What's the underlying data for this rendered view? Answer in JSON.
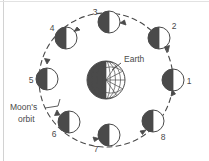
{
  "figure": {
    "title_text": "Moon phases diagram",
    "background_color": "#ffffff",
    "ink_color": "#3f3f3f",
    "dark_fill": "#4a4a4a",
    "light_fill": "#ffffff",
    "border": {
      "left_edge_color": "#cfcfcf",
      "top_edge_color": "#cfcfcf"
    }
  },
  "earth": {
    "label": "Earth",
    "center": {
      "x": 106,
      "y": 80
    },
    "radius": 19,
    "dark_half": "left",
    "grid_half": "right",
    "meridian_count": 5,
    "parallel_count": 3
  },
  "orbit": {
    "label_line1": "Moon's",
    "label_line2": "orbit",
    "center": {
      "x": 106,
      "y": 80
    },
    "radius": 67,
    "style": "dashed",
    "direction": "counterclockwise"
  },
  "moons": [
    {
      "id": "1",
      "label": "1",
      "angle_deg": 0,
      "cx": 173,
      "cy": 80,
      "r": 11,
      "dark_side": "left",
      "label_x": 189,
      "label_y": 84
    },
    {
      "id": "2",
      "label": "2",
      "angle_deg": 45,
      "cx": 159,
      "cy": 38,
      "r": 11,
      "dark_side": "left",
      "label_x": 174,
      "label_y": 29
    },
    {
      "id": "3",
      "label": "3",
      "angle_deg": 90,
      "cx": 109,
      "cy": 22,
      "r": 11,
      "dark_side": "left",
      "label_x": 95,
      "label_y": 15
    },
    {
      "id": "4",
      "label": "4",
      "angle_deg": 135,
      "cx": 66,
      "cy": 38,
      "r": 11,
      "dark_side": "left",
      "label_x": 52,
      "label_y": 31
    },
    {
      "id": "5",
      "label": "5",
      "angle_deg": 180,
      "cx": 47,
      "cy": 79,
      "r": 11,
      "dark_side": "left",
      "label_x": 31,
      "label_y": 83
    },
    {
      "id": "6",
      "label": "6",
      "angle_deg": 225,
      "cx": 69,
      "cy": 122,
      "r": 11,
      "dark_side": "left",
      "label_x": 54,
      "label_y": 137
    },
    {
      "id": "7",
      "label": "7",
      "angle_deg": 270,
      "cx": 109,
      "cy": 135,
      "r": 11,
      "dark_side": "left",
      "label_x": 96,
      "label_y": 152
    },
    {
      "id": "8",
      "label": "8",
      "angle_deg": 315,
      "cx": 153,
      "cy": 121,
      "r": 11,
      "dark_side": "left",
      "label_x": 163,
      "label_y": 140
    }
  ],
  "arrows": [
    {
      "name": "arrow-toward-1",
      "x": 170,
      "y": 97
    },
    {
      "name": "arrow-toward-2",
      "x": 164,
      "y": 52
    },
    {
      "name": "arrow-toward-3",
      "x": 124,
      "y": 22
    },
    {
      "name": "arrow-toward-4",
      "x": 79,
      "y": 31
    },
    {
      "name": "arrow-toward-5",
      "x": 48,
      "y": 64
    },
    {
      "name": "arrow-toward-6",
      "x": 58,
      "y": 110
    },
    {
      "name": "arrow-toward-7",
      "x": 94,
      "y": 136
    },
    {
      "name": "arrow-toward-8",
      "x": 141,
      "y": 130
    }
  ]
}
